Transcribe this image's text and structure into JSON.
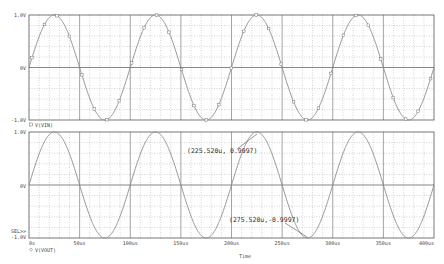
{
  "chart_data": [
    {
      "type": "line",
      "title": "",
      "legend": [
        {
          "marker": "square",
          "label": "V(VIN)"
        }
      ],
      "xlabel": "",
      "ylabel": "",
      "xlim": [
        0,
        400
      ],
      "x_unit": "us",
      "ylim": [
        -1.0,
        1.0
      ],
      "y_ticks": [
        "1.0V",
        "0V",
        "-1.0V"
      ],
      "grid": true,
      "series": [
        {
          "name": "V(VIN)",
          "frequency_hz": 10000,
          "amplitude_v": 1.0,
          "phase_deg": 0,
          "x": [
            0,
            25,
            50,
            75,
            100,
            125,
            150,
            175,
            200,
            225,
            250,
            275,
            300,
            325,
            350,
            375,
            400
          ],
          "y": [
            0,
            1,
            0,
            -1,
            0,
            1,
            0,
            -1,
            0,
            1,
            0,
            -1,
            0,
            1,
            0,
            -1,
            0
          ]
        }
      ]
    },
    {
      "type": "line",
      "title": "",
      "legend": [
        {
          "marker": "diamond",
          "label": "V(VOUT)"
        }
      ],
      "xlabel": "Time",
      "ylabel": "",
      "xlim": [
        0,
        400
      ],
      "x_unit": "us",
      "x_ticks": [
        "0s",
        "50us",
        "100us",
        "150us",
        "200us",
        "250us",
        "300us",
        "350us",
        "400us"
      ],
      "ylim": [
        -1.0,
        1.0
      ],
      "y_ticks": [
        "1.0V",
        "0V",
        "-1.0V"
      ],
      "grid": true,
      "series": [
        {
          "name": "V(VOUT)",
          "frequency_hz": 10000,
          "amplitude_v": 1.0,
          "phase_deg": 0,
          "x": [
            0,
            25,
            50,
            75,
            100,
            125,
            150,
            175,
            200,
            225,
            250,
            275,
            300,
            325,
            350,
            375,
            400
          ],
          "y": [
            0,
            1,
            0,
            -1,
            0,
            1,
            0,
            -1,
            0,
            1,
            0,
            -1,
            0,
            1,
            0,
            -1,
            0
          ]
        }
      ],
      "annotations": [
        {
          "text": "(225.520u, 0.9997)",
          "x_us": 225.52,
          "y": 0.9997
        },
        {
          "text": "(275.520u, -0.9997)",
          "x_us": 275.52,
          "y": -0.9997
        }
      ]
    }
  ],
  "upper_plot": {
    "y_labels": {
      "top": "1.0V",
      "mid": "0V",
      "bottom": "-1.0V"
    },
    "legend_label": "V(VIN)"
  },
  "lower_plot": {
    "y_labels": {
      "top": "1.0V",
      "mid": "0V",
      "bottom": "-1.0V"
    },
    "selector": "SEL>>",
    "legend_label": "V(VOUT)",
    "cursor1": "(225.520u, 0.9997)",
    "cursor2": "(275.520u,-0.9997)"
  },
  "x_axis": {
    "ticks": [
      "0s",
      "50us",
      "100us",
      "150us",
      "200us",
      "250us",
      "300us",
      "350us",
      "400us"
    ],
    "title": "Time"
  },
  "colors": {
    "trace": "#8a8a8a",
    "frame": "#555555",
    "grid": "#9a9a9a"
  }
}
